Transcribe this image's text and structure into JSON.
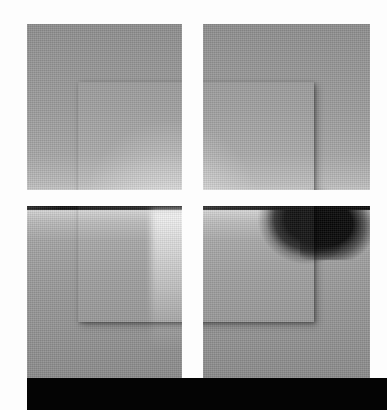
{
  "artwork": {
    "title": "Lake Horizon with Square Grid Overlay",
    "medium": "grayscale photograph",
    "width_px": 387,
    "height_px": 410,
    "background_color": "#fdfdfd"
  },
  "photo": {
    "name": "lake-horizon-photograph",
    "subject": "calm lake at dusk with mirrored horizon",
    "left_px": 27,
    "top_px": 24,
    "width_px": 343,
    "height_px": 354,
    "regions": {
      "sky": {
        "label": "sky",
        "top_color": "#8f8f8f",
        "bottom_color": "#e6e6e6"
      },
      "horizon": {
        "label": "horizon treeline",
        "color": "#101010",
        "top_px": 170
      },
      "water": {
        "label": "water reflection",
        "top_color": "#d6d6d6",
        "bottom_color": "#8c8c8c"
      },
      "foliage": {
        "label": "dark foliage cluster",
        "color": "#060606",
        "side": "right"
      },
      "sun_reflection": {
        "label": "sun glint column",
        "color": "#ffffff"
      }
    }
  },
  "overlays": {
    "inner_square": {
      "name": "inner-square-overlay",
      "left_px": 78,
      "top_px": 82,
      "width_px": 236,
      "height_px": 240,
      "shadow_color": "rgba(0,0,0,0.30)"
    },
    "cross": {
      "name": "white-cross-overlay",
      "color": "#fdfdfd",
      "vertical": {
        "left_px": 182,
        "width_px": 21
      },
      "horizontal": {
        "top_px": 190,
        "height_px": 16
      }
    },
    "black_band": {
      "name": "bottom-black-band",
      "color": "#040404",
      "left_px": 27,
      "top_px": 378,
      "height_px": 32
    }
  }
}
